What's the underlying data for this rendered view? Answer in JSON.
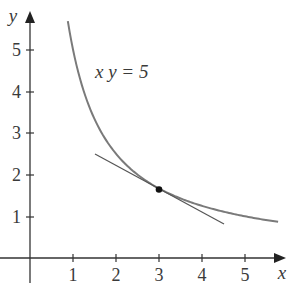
{
  "chart_data": {
    "type": "line",
    "title": "",
    "xlabel": "x",
    "ylabel": "y",
    "xlim": [
      -0.7,
      5.95
    ],
    "ylim": [
      -0.58,
      5.9
    ],
    "grid": false,
    "legend": null,
    "x_ticks": [
      1,
      2,
      3,
      4,
      5
    ],
    "y_ticks": [
      1,
      2,
      3,
      4,
      5
    ],
    "x_tick_labels": [
      "1",
      "2",
      "3",
      "4",
      "5"
    ],
    "y_tick_labels": [
      "1",
      "2",
      "3",
      "4",
      "5"
    ],
    "annotations": [
      {
        "text": "x y = 5",
        "x": 2.2,
        "y": 4.4
      }
    ],
    "series": [
      {
        "name": "xy = 5",
        "kind": "curve",
        "equation": "y = 5/x",
        "x_range": [
          0.88,
          5.77
        ],
        "color": "#7a7a7a"
      },
      {
        "name": "tangent at (3, 5/3)",
        "kind": "line",
        "equation": "y = 5/3 - (5/9)(x - 3)",
        "x_range": [
          1.5,
          4.5
        ],
        "color": "#555555"
      }
    ],
    "points": [
      {
        "name": "point of tangency",
        "x": 3,
        "y": 1.667,
        "color": "#111111"
      }
    ]
  },
  "labels": {
    "x_axis": "x",
    "y_axis": "y",
    "equation": "x y = 5",
    "x_ticks": [
      "1",
      "2",
      "3",
      "4",
      "5"
    ],
    "y_ticks": [
      "1",
      "2",
      "3",
      "4",
      "5"
    ]
  }
}
